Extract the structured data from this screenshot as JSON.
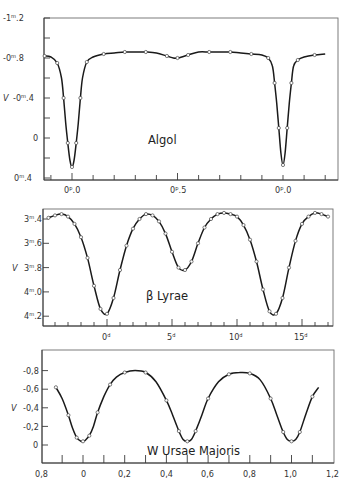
{
  "chart_data": [
    {
      "type": "line",
      "title": "Algol",
      "xlabel": "phase",
      "ylabel": "V",
      "x_ticklabels": [
        "0ᵖ.0",
        "0ᵖ.5",
        "0ᵖ.0"
      ],
      "y_ticklabels": [
        "-1ᵐ.2",
        "-0ᵐ.8",
        "-0ᵐ.4",
        "0",
        "0ᵐ.4"
      ],
      "y_tickvalues": [
        -1.2,
        -0.8,
        -0.4,
        0,
        0.4
      ],
      "ylim": [
        -1.2,
        0.4
      ],
      "xlim": [
        -0.14,
        1.26
      ],
      "grid": false,
      "series": [
        {
          "name": "Algol V magnitude",
          "x": [
            -0.13,
            -0.1,
            -0.07,
            -0.05,
            -0.04,
            -0.03,
            -0.02,
            -0.01,
            0.0,
            0.01,
            0.02,
            0.03,
            0.04,
            0.05,
            0.07,
            0.1,
            0.15,
            0.2,
            0.25,
            0.3,
            0.35,
            0.4,
            0.45,
            0.48,
            0.5,
            0.52,
            0.55,
            0.6,
            0.65,
            0.7,
            0.75,
            0.8,
            0.85,
            0.9,
            0.93,
            0.95,
            0.96,
            0.97,
            0.98,
            0.99,
            1.0,
            1.01,
            1.02,
            1.03,
            1.04,
            1.05,
            1.07,
            1.1,
            1.15,
            1.2
          ],
          "values": [
            -0.82,
            -0.81,
            -0.75,
            -0.6,
            -0.4,
            -0.15,
            0.05,
            0.22,
            0.29,
            0.22,
            0.05,
            -0.15,
            -0.4,
            -0.6,
            -0.76,
            -0.81,
            -0.84,
            -0.85,
            -0.86,
            -0.86,
            -0.86,
            -0.85,
            -0.82,
            -0.8,
            -0.8,
            -0.81,
            -0.83,
            -0.86,
            -0.86,
            -0.86,
            -0.86,
            -0.85,
            -0.84,
            -0.83,
            -0.8,
            -0.72,
            -0.55,
            -0.35,
            -0.1,
            0.15,
            0.27,
            0.15,
            -0.1,
            -0.35,
            -0.55,
            -0.72,
            -0.78,
            -0.81,
            -0.83,
            -0.84
          ]
        }
      ]
    },
    {
      "type": "line",
      "title": "β Lyrae",
      "xlabel": "days",
      "ylabel": "V",
      "x_ticklabels": [
        "0ᵈ",
        "5ᵈ",
        "10ᵈ",
        "15ᵈ"
      ],
      "x_tickvalues": [
        0,
        5,
        10,
        15
      ],
      "y_ticklabels": [
        "3ᵐ.4",
        "3ᵐ.6",
        "3ᵐ.8",
        "4ᵐ.0",
        "4ᵐ.2"
      ],
      "y_tickvalues": [
        3.4,
        3.6,
        3.8,
        4.0,
        4.2
      ],
      "ylim": [
        3.32,
        4.28
      ],
      "xlim": [
        -4.9,
        17.4
      ],
      "grid": false,
      "series": [
        {
          "name": "beta Lyrae V magnitude",
          "x": [
            -4.5,
            -4.0,
            -3.5,
            -3.0,
            -2.5,
            -2.0,
            -1.5,
            -1.0,
            -0.5,
            0.0,
            0.5,
            1.0,
            1.5,
            2.0,
            2.5,
            3.0,
            3.5,
            4.0,
            4.5,
            5.0,
            5.5,
            6.0,
            6.5,
            7.0,
            7.5,
            8.0,
            8.5,
            9.0,
            9.5,
            10.0,
            10.5,
            11.0,
            11.5,
            12.0,
            12.5,
            13.0,
            13.5,
            14.0,
            14.5,
            15.0,
            15.5,
            16.0,
            16.5,
            17.0
          ],
          "values": [
            3.39,
            3.37,
            3.36,
            3.38,
            3.44,
            3.55,
            3.72,
            3.95,
            4.14,
            4.18,
            4.05,
            3.82,
            3.62,
            3.48,
            3.4,
            3.36,
            3.37,
            3.42,
            3.52,
            3.67,
            3.8,
            3.82,
            3.75,
            3.6,
            3.47,
            3.4,
            3.36,
            3.35,
            3.36,
            3.38,
            3.45,
            3.57,
            3.75,
            3.98,
            4.16,
            4.18,
            4.05,
            3.8,
            3.58,
            3.44,
            3.38,
            3.35,
            3.36,
            3.38
          ]
        }
      ]
    },
    {
      "type": "line",
      "title": "W Ursae Majoris",
      "xlabel": "phase",
      "ylabel": "V",
      "x_ticklabels": [
        "0,8",
        "0",
        "0,2",
        "0,4",
        "0,6",
        "0,8",
        "1,0",
        "1,2"
      ],
      "x_tickvalues": [
        -0.2,
        0,
        0.2,
        0.4,
        0.6,
        0.8,
        1.0,
        1.2
      ],
      "y_ticklabels": [
        "-0,8",
        "-0,6",
        "-0,4",
        "-0,2",
        "0"
      ],
      "y_tickvalues": [
        -0.8,
        -0.6,
        -0.4,
        -0.2,
        0
      ],
      "ylim": [
        -1.0,
        0.2
      ],
      "xlim": [
        -0.2,
        1.2
      ],
      "grid": false,
      "series": [
        {
          "name": "W UMa V magnitude",
          "x": [
            -0.13,
            -0.1,
            -0.07,
            -0.05,
            -0.03,
            -0.01,
            0.0,
            0.01,
            0.03,
            0.05,
            0.07,
            0.1,
            0.13,
            0.16,
            0.2,
            0.25,
            0.3,
            0.35,
            0.4,
            0.43,
            0.46,
            0.48,
            0.5,
            0.52,
            0.54,
            0.57,
            0.6,
            0.65,
            0.7,
            0.75,
            0.8,
            0.85,
            0.9,
            0.93,
            0.96,
            0.98,
            1.0,
            1.02,
            1.04,
            1.07,
            1.1,
            1.13
          ],
          "values": [
            -0.62,
            -0.5,
            -0.32,
            -0.18,
            -0.08,
            -0.04,
            -0.04,
            -0.05,
            -0.1,
            -0.2,
            -0.35,
            -0.52,
            -0.65,
            -0.73,
            -0.78,
            -0.8,
            -0.78,
            -0.68,
            -0.48,
            -0.32,
            -0.15,
            -0.06,
            -0.04,
            -0.06,
            -0.15,
            -0.32,
            -0.5,
            -0.68,
            -0.76,
            -0.78,
            -0.77,
            -0.7,
            -0.5,
            -0.32,
            -0.14,
            -0.06,
            -0.04,
            -0.06,
            -0.14,
            -0.34,
            -0.52,
            -0.62
          ]
        }
      ]
    }
  ],
  "panels": {
    "algol": {
      "name": "Algol",
      "ylabel": "V",
      "yticks": [
        "-1ᵐ.2",
        "-0ᵐ.8",
        "-0ᵐ.4",
        "0",
        "0ᵐ.4"
      ],
      "xticks": [
        "0ᵖ.0",
        "0ᵖ.5",
        "0ᵖ.0"
      ]
    },
    "blyr": {
      "name": "β Lyrae",
      "ylabel": "V",
      "yticks": [
        "3ᵐ.4",
        "3ᵐ.6",
        "3ᵐ.8",
        "4ᵐ.0",
        "4ᵐ.2"
      ],
      "xticks": [
        "0ᵈ",
        "5ᵈ",
        "10ᵈ",
        "15ᵈ"
      ]
    },
    "wuma": {
      "name": "W Ursae Majoris",
      "ylabel": "V",
      "yticks": [
        "-0,8",
        "-0,6",
        "-0,4",
        "-0,2",
        "0"
      ],
      "xticks": [
        "0,8",
        "0",
        "0,2",
        "0,4",
        "0,6",
        "0,8",
        "1,0",
        "1,2"
      ]
    }
  }
}
